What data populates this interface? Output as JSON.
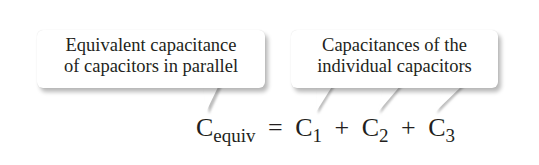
{
  "callouts": {
    "left": {
      "lines": [
        "Equivalent capacitance",
        "of capacitors in parallel"
      ]
    },
    "right": {
      "lines": [
        "Capacitances of the",
        "individual capacitors"
      ]
    }
  },
  "equation": {
    "lhs_symbol": "C",
    "lhs_sub": "equiv",
    "equals": "=",
    "terms": [
      {
        "symbol": "C",
        "sub": "1"
      },
      {
        "symbol": "C",
        "sub": "2"
      },
      {
        "symbol": "C",
        "sub": "3"
      }
    ],
    "plus": "+"
  }
}
